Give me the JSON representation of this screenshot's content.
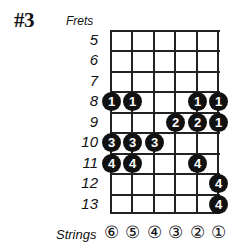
{
  "title": "#3",
  "frets_label": "Frets",
  "strings_label": "Strings",
  "fret_numbers": [
    "5",
    "6",
    "7",
    "8",
    "9",
    "10",
    "11",
    "12",
    "13"
  ],
  "string_labels": [
    "⑥",
    "⑤",
    "④",
    "③",
    "②",
    "①"
  ],
  "colors": {
    "line": "#222222",
    "dot": "#111111",
    "dot_text": "#ffffff"
  },
  "dots": [
    {
      "fret": "8",
      "string": 6,
      "finger": "1"
    },
    {
      "fret": "8",
      "string": 5,
      "finger": "1"
    },
    {
      "fret": "8",
      "string": 2,
      "finger": "1"
    },
    {
      "fret": "8",
      "string": 1,
      "finger": "1"
    },
    {
      "fret": "9",
      "string": 3,
      "finger": "2"
    },
    {
      "fret": "9",
      "string": 2,
      "finger": "2"
    },
    {
      "fret": "9",
      "string": 1,
      "finger": "1"
    },
    {
      "fret": "10",
      "string": 6,
      "finger": "3"
    },
    {
      "fret": "10",
      "string": 5,
      "finger": "3"
    },
    {
      "fret": "10",
      "string": 4,
      "finger": "3"
    },
    {
      "fret": "11",
      "string": 6,
      "finger": "4"
    },
    {
      "fret": "11",
      "string": 5,
      "finger": "4"
    },
    {
      "fret": "11",
      "string": 2,
      "finger": "4"
    },
    {
      "fret": "12",
      "string": 1,
      "finger": "4"
    },
    {
      "fret": "13",
      "string": 1,
      "finger": "4"
    }
  ]
}
